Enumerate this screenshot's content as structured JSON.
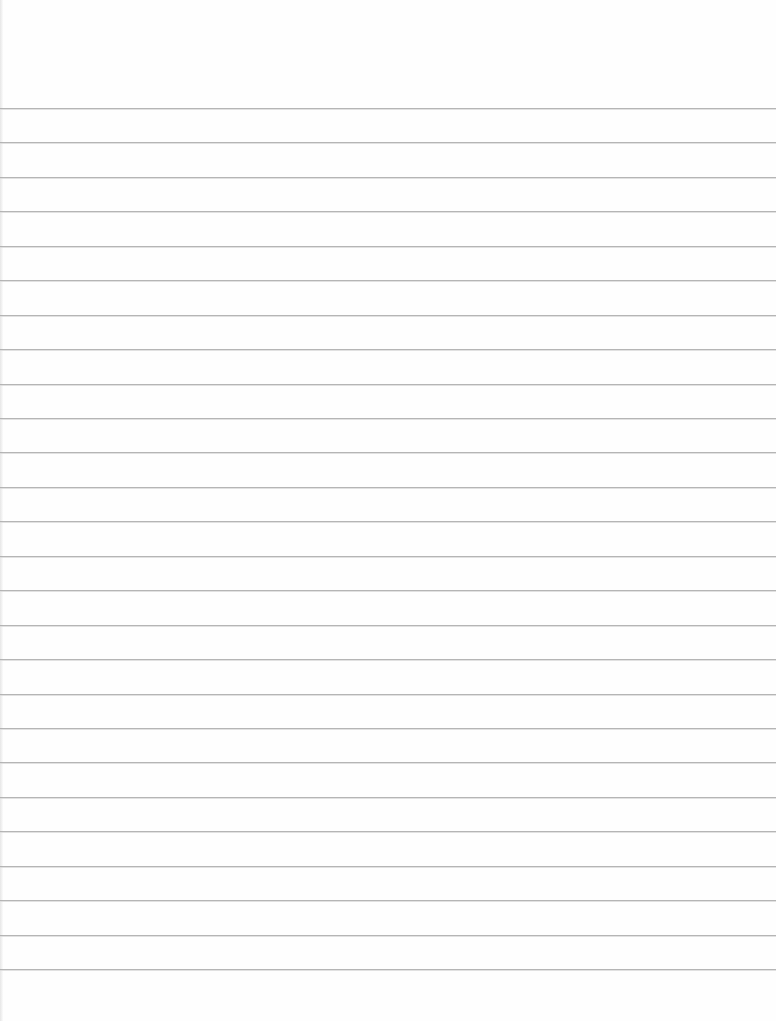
{
  "page": {
    "type": "blank ruled paper",
    "background_color": "#fefefe",
    "line_color": "#a9a9a9"
  },
  "ruled_lines": {
    "count": 26,
    "first_y": 108,
    "spacing": 34.44,
    "positions": [
      108,
      142,
      177,
      211,
      246,
      280,
      315,
      349,
      384,
      418,
      452,
      487,
      521,
      556,
      590,
      625,
      659,
      694,
      728,
      762,
      797,
      831,
      866,
      900,
      935,
      969
    ]
  }
}
